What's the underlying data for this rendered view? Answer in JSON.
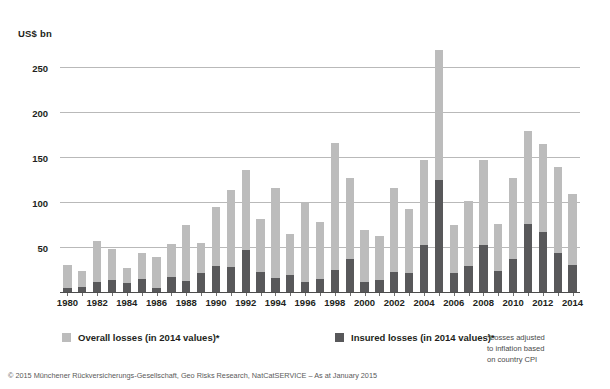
{
  "axis_title": "US$ bn",
  "y_axis": {
    "ticks": [
      0,
      50,
      100,
      150,
      200,
      250
    ],
    "tick_labels": [
      "",
      "50",
      "100",
      "150",
      "200",
      "250"
    ],
    "min": 0,
    "max": 275
  },
  "legend": {
    "overall": {
      "label": "Overall losses (in 2014 values)*",
      "color": "#bcbcbc",
      "swatch_name": "overall-losses-swatch"
    },
    "insured": {
      "label": "Insured losses (in 2014 values)*",
      "color": "#58585a",
      "swatch_name": "insured-losses-swatch"
    }
  },
  "footnote": [
    "*Losses adjusted",
    "to inflation based",
    "on country CPI"
  ],
  "copyright": "© 2015 Münchener Rückversicherungs-Gesellschaft, Geo Risks Research, NatCatSERVICE – As at January 2015",
  "chart_data": {
    "type": "bar",
    "title": "",
    "subtitle": "",
    "xlabel": "",
    "ylabel": "US$ bn",
    "ylim": [
      0,
      275
    ],
    "grid": true,
    "stacked": true,
    "legend_position": "bottom",
    "categories": [
      "1980",
      "1981",
      "1982",
      "1983",
      "1984",
      "1985",
      "1986",
      "1987",
      "1988",
      "1989",
      "1990",
      "1991",
      "1992",
      "1993",
      "1994",
      "1995",
      "1996",
      "1997",
      "1998",
      "1999",
      "2000",
      "2001",
      "2002",
      "2003",
      "2004",
      "2005",
      "2006",
      "2007",
      "2008",
      "2009",
      "2010",
      "2011",
      "2012",
      "2013",
      "2014"
    ],
    "x_tick_labels": [
      "1980",
      "1982",
      "1984",
      "1986",
      "1988",
      "1990",
      "1992",
      "1994",
      "1996",
      "1998",
      "2000",
      "2002",
      "2004",
      "2006",
      "2008",
      "2010",
      "2012",
      "2014"
    ],
    "series": [
      {
        "name": "Overall losses (in 2014 values)*",
        "color": "#bcbcbc",
        "values": [
          31,
          24,
          58,
          49,
          28,
          44,
          40,
          54,
          75,
          56,
          95,
          114,
          136,
          82,
          117,
          66,
          100,
          79,
          166,
          127,
          70,
          63,
          117,
          93,
          147,
          270,
          75,
          102,
          147,
          77,
          128,
          180,
          165,
          140,
          110
        ]
      },
      {
        "name": "Insured losses (in 2014 values)*",
        "color": "#58585a",
        "values": [
          6,
          7,
          12,
          14,
          11,
          16,
          6,
          18,
          13,
          22,
          30,
          29,
          48,
          23,
          17,
          20,
          12,
          15,
          26,
          38,
          12,
          14,
          23,
          22,
          53,
          125,
          22,
          30,
          53,
          24,
          38,
          76,
          68,
          44,
          31
        ]
      }
    ]
  }
}
